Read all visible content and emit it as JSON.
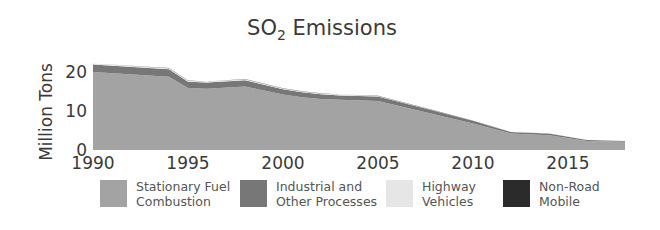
{
  "chart_data": {
    "type": "area",
    "stacked": true,
    "title": "SO2 Emissions",
    "title_main": "SO",
    "title_sub": "2",
    "title_rest": " Emissions",
    "xlabel": "",
    "ylabel": "Million Tons",
    "xlim": [
      1990,
      2018
    ],
    "ylim": [
      0,
      24
    ],
    "x_ticks": [
      1990,
      1995,
      2000,
      2005,
      2010,
      2015
    ],
    "y_ticks": [
      0,
      10,
      20
    ],
    "grid": false,
    "legend_position": "bottom",
    "x": [
      1990,
      1994,
      1995,
      1996,
      1998,
      2000,
      2001,
      2002,
      2003,
      2005,
      2008,
      2010,
      2012,
      2014,
      2016,
      2018
    ],
    "series": [
      {
        "name": "Stationary Fuel Combustion",
        "color": "#a3a3a3",
        "values": [
          20.0,
          18.8,
          15.9,
          15.7,
          16.3,
          14.2,
          13.5,
          13.1,
          12.9,
          12.6,
          9.1,
          6.8,
          4.2,
          3.8,
          2.3,
          2.1
        ]
      },
      {
        "name": "Industrial and Other Processes",
        "color": "#777777",
        "values": [
          1.9,
          1.9,
          1.6,
          1.6,
          1.6,
          1.4,
          1.3,
          1.2,
          1.1,
          1.1,
          0.9,
          0.6,
          0.45,
          0.45,
          0.27,
          0.18
        ]
      },
      {
        "name": "Highway Vehicles",
        "color": "#e4e4e4",
        "values": [
          0.25,
          0.25,
          0.25,
          0.25,
          0.25,
          0.2,
          0.2,
          0.2,
          0.2,
          0.15,
          0.07,
          0.07,
          0.04,
          0.04,
          0.02,
          0.02
        ]
      },
      {
        "name": "Non-Road Mobile",
        "color": "#2b2b2b",
        "values": [
          0.05,
          0.05,
          0.05,
          0.05,
          0.05,
          0.05,
          0.05,
          0.05,
          0.05,
          0.05,
          0.03,
          0.03,
          0.01,
          0.01,
          0.01,
          0.0
        ]
      }
    ]
  },
  "legend": {
    "items": [
      {
        "label": "Stationary Fuel\nCombustion",
        "color": "#a3a3a3"
      },
      {
        "label": "Industrial and\nOther Processes",
        "color": "#777777"
      },
      {
        "label": "Highway\nVehicles",
        "color": "#e6e6e6"
      },
      {
        "label": "Non-Road\nMobile",
        "color": "#2b2b2b"
      }
    ]
  }
}
